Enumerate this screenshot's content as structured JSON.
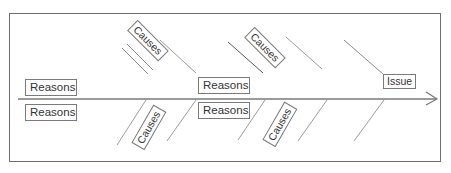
{
  "diagram": {
    "type": "fishbone",
    "frame_color": "#6e6e6e",
    "line_color": "#8a8a8a",
    "dark_line_color": "#555555",
    "head": {
      "label": "Issue"
    },
    "reasons": [
      {
        "label": "Reasons"
      },
      {
        "label": "Reasons"
      },
      {
        "label": "Reasons"
      },
      {
        "label": "Reasons"
      }
    ],
    "causes": [
      {
        "label": "Causes"
      },
      {
        "label": "Causes"
      },
      {
        "label": "Causes"
      },
      {
        "label": "Causes"
      }
    ]
  }
}
